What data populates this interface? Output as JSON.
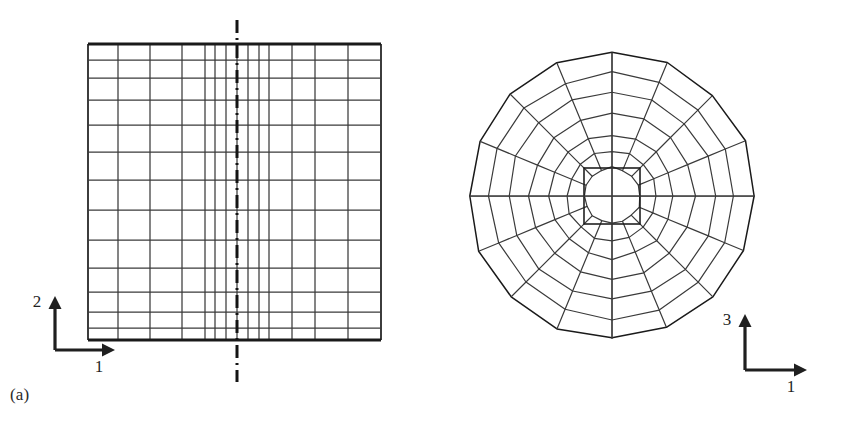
{
  "figure": {
    "type": "finite-element-mesh-figure",
    "background": "#ffffff",
    "line_color": "#3a3a3a",
    "heavy_line_color": "#1a1a1a",
    "width": 841,
    "height": 434
  },
  "panel_a": {
    "caption": "(a)",
    "name": "rectangular-structured-mesh",
    "axis": {
      "vertical_label": "2",
      "horizontal_label": "1",
      "origin_x": 55,
      "origin_y": 350,
      "v_length": 52,
      "h_length": 58
    },
    "symmetry_line": {
      "style": "dash-dot",
      "x": 237,
      "y_top": 20,
      "y_bottom": 382
    },
    "grid": {
      "left": 88,
      "right": 381,
      "top": 44,
      "bottom": 340,
      "x_lines": [
        88,
        118,
        150,
        182,
        205,
        215,
        226,
        237,
        248,
        259,
        269,
        292,
        315,
        348,
        381
      ],
      "y_lines": [
        44,
        60,
        78,
        100,
        125,
        152,
        180,
        210,
        240,
        268,
        292,
        312,
        328,
        340
      ],
      "heavy_edges": [
        "top",
        "bottom"
      ]
    }
  },
  "panel_b": {
    "caption": "(b)",
    "name": "circular-polar-butterfly-mesh",
    "axis": {
      "vertical_label": "3",
      "horizontal_label": "1",
      "origin_x": 745,
      "origin_y": 370,
      "v_length": 54,
      "h_length": 60
    },
    "mesh": {
      "center_x": 612,
      "center_y": 196,
      "outer_radius": 143,
      "ring_radii": [
        28,
        45,
        62,
        82,
        103,
        123,
        143
      ],
      "core_half_size": 28,
      "sector_count": 16,
      "ring_count": 7
    }
  },
  "chart_data": {
    "type": "diagram",
    "title": "",
    "subtitle": "",
    "panels": [
      {
        "id": "a",
        "label": "(a)",
        "description": "Rectangular structured quadrilateral mesh with vertical symmetry centerline; mesh graded finer toward the centerline and toward top and bottom edges.",
        "axes": [
          "1",
          "2"
        ],
        "columns": 14,
        "rows": 13
      },
      {
        "id": "b",
        "label": "(b)",
        "description": "Circular polar mesh with square core block and seven concentric rings subdivided into sixteen radial sectors.",
        "axes": [
          "1",
          "3"
        ],
        "rings": 7,
        "sectors": 16
      }
    ]
  }
}
